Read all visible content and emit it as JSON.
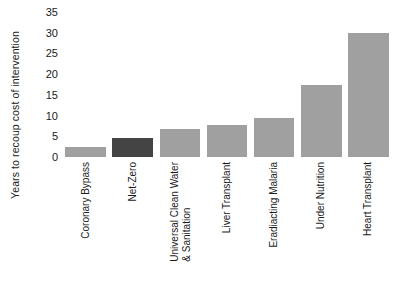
{
  "chart_data": {
    "type": "bar",
    "title": "",
    "subtitle": "",
    "xlabel": "",
    "ylabel": "Years to recoup cost of intervention",
    "ylim": [
      0,
      35
    ],
    "ytick_values": [
      0,
      5,
      10,
      15,
      20,
      25,
      30,
      35
    ],
    "ytick_labels": [
      "0",
      "5",
      "10",
      "15",
      "20",
      "25",
      "30",
      "35"
    ],
    "grid": false,
    "legend": null,
    "orientation": "vertical",
    "categories": [
      "Coronary Bypass",
      "Net-Zero",
      "Universal Clean Water & Sanitation",
      "Liver Transplant",
      "Eradiacting Malaria",
      "Under Nutrition",
      "Heart Transplant"
    ],
    "category_label_lines": [
      [
        "Coronary Bypass"
      ],
      [
        "Net-Zero"
      ],
      [
        "Universal Clean Water",
        "& Sanitation"
      ],
      [
        "Liver Transplant"
      ],
      [
        "Eradiacting Malaria"
      ],
      [
        "Under Nutrition"
      ],
      [
        "Heart Transplant"
      ]
    ],
    "values": [
      2.4,
      4.5,
      6.8,
      7.8,
      9.3,
      17.5,
      30.0
    ],
    "bar_colors": [
      "#a0a0a0",
      "#444444",
      "#a0a0a0",
      "#a0a0a0",
      "#a0a0a0",
      "#a0a0a0",
      "#a0a0a0"
    ],
    "highlight_index": 1,
    "colors": {
      "default_bar": "#a0a0a0",
      "highlight_bar": "#444444",
      "text": "#1a1a1a",
      "background": "#ffffff"
    }
  }
}
